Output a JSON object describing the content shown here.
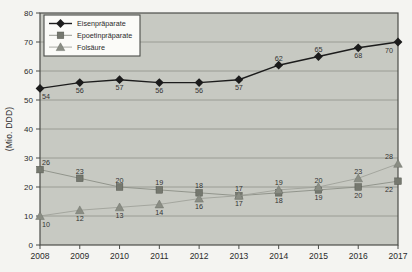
{
  "chart_data": {
    "type": "line",
    "title": "",
    "xlabel": "",
    "ylabel": "(Mio. DDD)",
    "x": [
      "2008",
      "2009",
      "2010",
      "2011",
      "2012",
      "2013",
      "2014",
      "2015",
      "2016",
      "2017"
    ],
    "y_ticks": [
      0,
      10,
      20,
      30,
      40,
      50,
      60,
      70,
      80
    ],
    "ylim": [
      0,
      80
    ],
    "grid": true,
    "legend_position": "top-left",
    "series": [
      {
        "name": "Eisenpräparate",
        "marker": "diamond",
        "marker_color": "#1c1c1c",
        "line_color": "#1c1c1c",
        "values": [
          54,
          56,
          57,
          56,
          56,
          57,
          62,
          65,
          68,
          70
        ],
        "label_positions": [
          "below",
          "below",
          "below",
          "below",
          "below",
          "below",
          "above",
          "above",
          "below",
          "below"
        ]
      },
      {
        "name": "Epoetinpräparate",
        "marker": "square",
        "marker_color": "#75786f",
        "line_color": "#8b8e86",
        "values": [
          26,
          23,
          20,
          19,
          18,
          17,
          18,
          19,
          20,
          22
        ],
        "label_positions": [
          "above",
          "above",
          "above",
          "above",
          "above",
          "below",
          "below",
          "below",
          "below",
          "below"
        ]
      },
      {
        "name": "Folsäure",
        "marker": "triangle",
        "marker_color": "#8a8d84",
        "line_color": "#9fa29a",
        "values": [
          10,
          12,
          13,
          14,
          16,
          17,
          19,
          20,
          23,
          28
        ],
        "label_positions": [
          "below",
          "below",
          "below",
          "below",
          "below",
          "above",
          "above",
          "above",
          "above",
          "above"
        ]
      }
    ],
    "colors": {
      "outer_bg": "#f4f4f1",
      "plot_bg": "#c7c9c2",
      "grid": "#82857d",
      "border": "#4b4d49",
      "tick_text": "#2a2a2a",
      "data_label": "#333333",
      "legend_bg": "#fbfbf8",
      "legend_border": "#4b4d49"
    }
  }
}
